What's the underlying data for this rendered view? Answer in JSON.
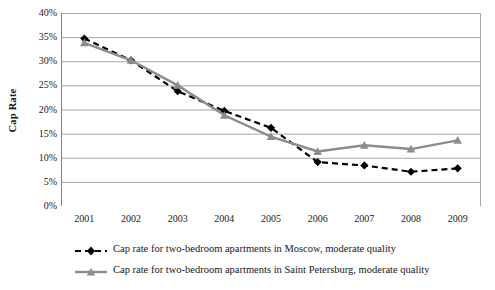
{
  "chart_data": {
    "type": "line",
    "title": "",
    "xlabel": "",
    "ylabel": "Cap Rate",
    "categories": [
      "2001",
      "2002",
      "2003",
      "2004",
      "2005",
      "2006",
      "2007",
      "2008",
      "2009"
    ],
    "x": [
      2001,
      2002,
      2003,
      2004,
      2005,
      2006,
      2007,
      2008,
      2009
    ],
    "ylim": [
      0,
      40
    ],
    "ytick_labels": [
      "0%",
      "5%",
      "10%",
      "15%",
      "20%",
      "25%",
      "30%",
      "35%",
      "40%"
    ],
    "ytick_values": [
      0,
      5,
      10,
      15,
      20,
      25,
      30,
      35,
      40
    ],
    "grid": true,
    "legend_position": "bottom",
    "series": [
      {
        "name": "Cap rate for two-bedroom apartments in Moscow, moderate quality",
        "values": [
          34.7,
          30.2,
          23.8,
          19.7,
          16.2,
          9.1,
          8.4,
          7.1,
          7.8
        ],
        "color": "#000000",
        "line_style": "dashed",
        "marker": "diamond"
      },
      {
        "name": "Cap rate for two-bedroom apartments in Saint Petersburg, moderate quality",
        "values": [
          33.8,
          30.2,
          25.0,
          18.8,
          14.4,
          11.3,
          12.6,
          11.8,
          13.6
        ],
        "color": "#8c8c8c",
        "line_style": "solid",
        "marker": "triangle"
      }
    ]
  },
  "axes": {
    "y_title": "Cap Rate"
  },
  "colors": {
    "series_moscow": "#000000",
    "series_spb": "#8c8c8c",
    "gridline": "#a6a6a6",
    "axis": "#808080",
    "background": "#ffffff"
  }
}
